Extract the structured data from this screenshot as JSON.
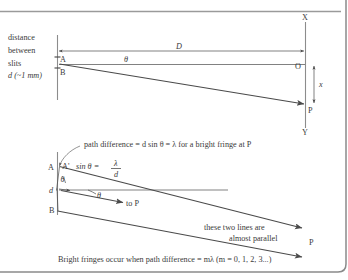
{
  "figure": {
    "background_color": "#ffffff",
    "ink_color": "#4a4a4a",
    "text_color": "#3a3a3a"
  },
  "top_diagram": {
    "slit_label_lines": [
      "distance",
      "between",
      "slits"
    ],
    "slit_separation_label": "d (~1 mm)",
    "point_a": "A",
    "point_b": "B",
    "angle_theta": "θ",
    "distance_label": "D",
    "screen_top": "X",
    "screen_bottom": "Y",
    "centre_point": "O",
    "fringe_point": "P",
    "fringe_offset_label": "x"
  },
  "bottom_diagram": {
    "callout_text": "path difference = d sin θ = λ for a bright fringe at P",
    "point_a": "A",
    "point_a_prime": "A'",
    "equation_lhs": "sin θ  =",
    "equation_numerator": "λ",
    "equation_denominator": "d",
    "slit_gap_label": "d",
    "angle_theta_upper": "θ",
    "angle_theta_lower": "θ",
    "point_b": "B",
    "to_p_label": "to P",
    "parallel_note_line1": "these two lines are",
    "parallel_note_line2": "almost parallel",
    "fringe_point": "P"
  },
  "caption": {
    "text": "Bright fringes occur when path difference = mλ (m = 0, 1, 2, 3...)"
  }
}
